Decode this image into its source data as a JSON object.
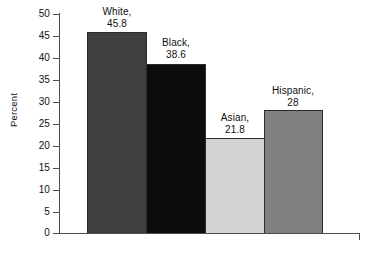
{
  "chart_data": {
    "type": "bar",
    "title": "",
    "xlabel": "",
    "ylabel": "Percent",
    "categories": [
      "White",
      "Black",
      "Asian",
      "Hispanic"
    ],
    "values": [
      45.8,
      38.6,
      21.8,
      28
    ],
    "value_labels": [
      "45.8",
      "38.6",
      "21.8",
      "28"
    ],
    "point_labels": [
      "White,\n45.8",
      "Black,\n38.6",
      "Asian,\n21.8",
      "Hispanic,\n28"
    ],
    "ylim": [
      0,
      50
    ],
    "ytick_labels": [
      "50",
      "45",
      "40",
      "35",
      "30",
      "25",
      "20",
      "15",
      "10",
      "5",
      "0"
    ],
    "ytick_values": [
      50,
      45,
      40,
      35,
      30,
      25,
      20,
      15,
      10,
      5,
      0
    ],
    "xtick_labels": [],
    "grid": false,
    "legend": false,
    "series": [
      {
        "name": "Percent",
        "values": [
          45.8,
          38.6,
          21.8,
          28
        ]
      }
    ],
    "bar_colors": [
      "#3f3f3f",
      "#0d0d0d",
      "#d3d3d3",
      "#808080"
    ],
    "bar_border_color": "#2b2b2b",
    "axis_color": "#4d4d4d",
    "background_color": "#ffffff",
    "text_color": "#111111"
  },
  "labels": {
    "cat0_name": "White,",
    "cat0_value": "45.8",
    "cat1_name": "Black,",
    "cat1_value": "38.6",
    "cat2_name": "Asian,",
    "cat2_value": "21.8",
    "cat3_name": "Hispanic,",
    "cat3_value": "28"
  },
  "axis": {
    "y_title": "Percent",
    "t0": "50",
    "t1": "45",
    "t2": "40",
    "t3": "35",
    "t4": "30",
    "t5": "25",
    "t6": "20",
    "t7": "15",
    "t8": "10",
    "t9": "5",
    "t10": "0"
  }
}
